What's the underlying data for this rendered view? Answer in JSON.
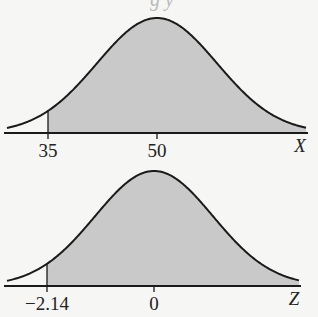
{
  "header": {
    "partial_text": "g        y"
  },
  "colors": {
    "fill": "#c9c9c9",
    "stroke": "#1a1a1a",
    "background": "#f6f6f4"
  },
  "chart_data": [
    {
      "type": "area",
      "title": "",
      "distribution": "normal",
      "xlabel": "X",
      "mean": 50,
      "shaded_region": "right of 35",
      "boundary": 35,
      "tick_labels": [
        "35",
        "50"
      ],
      "tick_values": [
        35,
        50
      ],
      "grid": false
    },
    {
      "type": "area",
      "title": "",
      "distribution": "standard normal",
      "xlabel": "Z",
      "mean": 0,
      "shaded_region": "right of -2.14",
      "boundary": -2.14,
      "tick_labels": [
        "−2.14",
        "0"
      ],
      "tick_values": [
        -2.14,
        0
      ],
      "grid": false
    }
  ],
  "geometry": [
    {
      "cx": 157,
      "axisY": 133,
      "peak": 115,
      "sigma": 60,
      "x0": 7,
      "x1": 306,
      "axisX0": 4,
      "axisX1": 308,
      "cut": 48,
      "labelY": 157,
      "axLabelX": 300,
      "axLabelY": 152
    },
    {
      "cx": 154,
      "axisY": 286,
      "peak": 115,
      "sigma": 59,
      "x0": 7,
      "x1": 299,
      "axisX0": 4,
      "axisX1": 301,
      "cut": 47,
      "labelY": 310,
      "axLabelX": 294,
      "axLabelY": 305
    }
  ]
}
